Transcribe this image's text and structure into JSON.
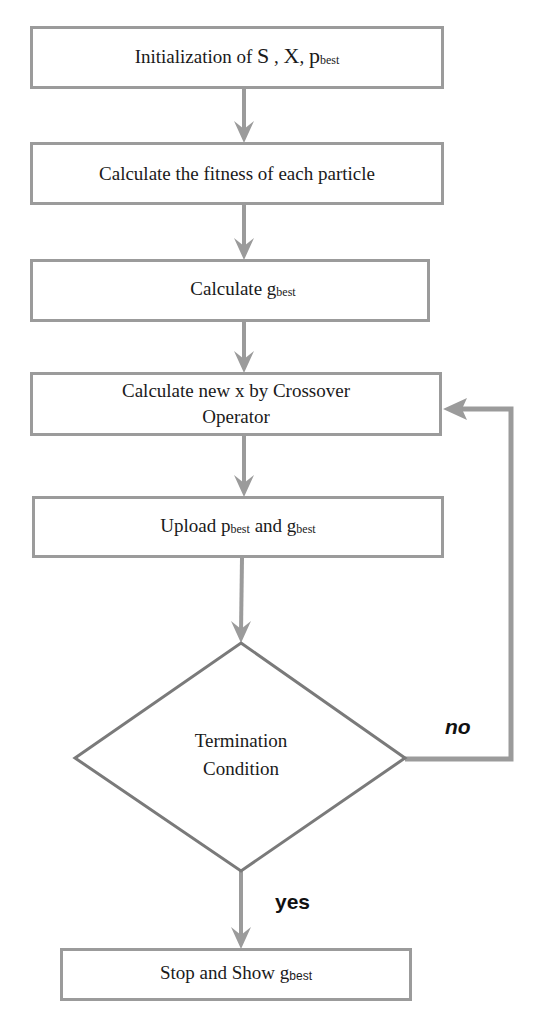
{
  "diagram": {
    "type": "flowchart",
    "colors": {
      "box_border": "#9b9b9b",
      "arrow": "#9b9b9b",
      "diamond_border": "#7a7a7a",
      "text": "#1a1a1a"
    },
    "nodes": [
      {
        "id": "init",
        "shape": "rect",
        "text_parts": [
          "Initialization of ",
          "S",
          " , ",
          "X",
          ", ",
          "p",
          "best"
        ]
      },
      {
        "id": "fitness",
        "shape": "rect",
        "text": "Calculate the fitness of each particle"
      },
      {
        "id": "gbest",
        "shape": "rect",
        "text_parts": [
          "Calculate g",
          "best"
        ]
      },
      {
        "id": "crossover",
        "shape": "rect",
        "line1": "Calculate new x by Crossover",
        "line2": "Operator"
      },
      {
        "id": "upload",
        "shape": "rect",
        "text_parts": [
          "Upload p",
          "best",
          " and g",
          "best"
        ]
      },
      {
        "id": "termination",
        "shape": "diamond",
        "line1": "Termination",
        "line2": "Condition"
      },
      {
        "id": "stop",
        "shape": "rect",
        "text_parts": [
          "Stop and Show g",
          "best"
        ]
      }
    ],
    "edges": [
      {
        "from": "init",
        "to": "fitness"
      },
      {
        "from": "fitness",
        "to": "gbest"
      },
      {
        "from": "gbest",
        "to": "crossover"
      },
      {
        "from": "crossover",
        "to": "upload"
      },
      {
        "from": "upload",
        "to": "termination"
      },
      {
        "from": "termination",
        "to": "crossover",
        "label": "no"
      },
      {
        "from": "termination",
        "to": "stop",
        "label": "yes"
      }
    ],
    "labels": {
      "no": "no",
      "yes": "yes"
    }
  }
}
